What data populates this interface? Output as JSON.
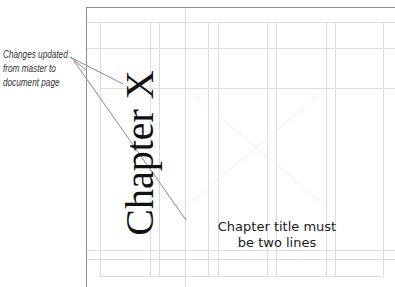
{
  "document": {
    "chapter_title": "Chapter X",
    "frame_placeholder": "empty-graphic-frame"
  },
  "annotations": {
    "left_note": {
      "lines": [
        "Changes updated",
        "from master to",
        "document page"
      ]
    },
    "right_note": {
      "lines": [
        "Chapter title must",
        "be two lines"
      ]
    }
  },
  "colors": {
    "page_border": "#8c8c8c",
    "guide": "#d9d9d9",
    "callout_line": "#8a8a8a",
    "placeholder_x": "#eeeeee",
    "title_text": "#111111"
  }
}
